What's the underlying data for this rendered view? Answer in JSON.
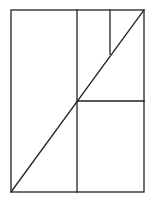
{
  "diagram": {
    "type": "geometric-subdivision",
    "background": "#ffffff",
    "stroke_color": "#222222",
    "stroke_width": 1.3,
    "outer_rect": {
      "x1": 11,
      "y1": 10,
      "x2": 144,
      "y2": 192
    },
    "lines": [
      {
        "name": "vertical-divider-main",
        "x1": 77,
        "y1": 10,
        "x2": 77,
        "y2": 192
      },
      {
        "name": "horizontal-divider-right",
        "x1": 77,
        "y1": 101,
        "x2": 144,
        "y2": 101
      },
      {
        "name": "vertical-divider-small",
        "x1": 110,
        "y1": 10,
        "x2": 110,
        "y2": 54
      },
      {
        "name": "diagonal",
        "x1": 11,
        "y1": 192,
        "x2": 144,
        "y2": 10
      }
    ]
  }
}
